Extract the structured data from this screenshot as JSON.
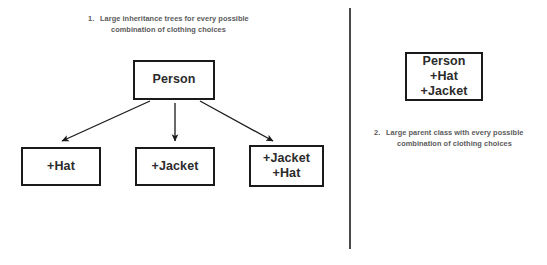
{
  "diagram": {
    "title_visible": false,
    "colors": {
      "box_border": "#1a1a1a",
      "box_text": "#2b2b2b",
      "caption_text": "#5b5b5b",
      "arrow": "#1a1a1a",
      "divider": "#4a4a4a",
      "background": "#ffffff"
    },
    "left_panel": {
      "caption": {
        "number": "1.",
        "line1": "Large inheritance trees for every possible",
        "line2": "combination of clothing choices"
      },
      "parent_box": {
        "lines": [
          "Person"
        ]
      },
      "child_boxes": [
        {
          "lines": [
            "+Hat"
          ]
        },
        {
          "lines": [
            "+Jacket"
          ]
        },
        {
          "lines": [
            "+Jacket",
            "+Hat"
          ]
        }
      ],
      "arrows": [
        {
          "name": "arrow-person-to-hat",
          "from": [
            150,
            101
          ],
          "to": [
            62,
            141
          ]
        },
        {
          "name": "arrow-person-to-jacket",
          "from": [
            175,
            103
          ],
          "to": [
            175,
            141
          ]
        },
        {
          "name": "arrow-person-to-jacket-hat",
          "from": [
            200,
            101
          ],
          "to": [
            273,
            141
          ]
        }
      ]
    },
    "right_panel": {
      "combined_box": {
        "lines": [
          "Person",
          "+Hat",
          "+Jacket"
        ]
      },
      "caption": {
        "number": "2.",
        "line1": "Large parent class with every possible",
        "line2": "combination of clothing choices"
      }
    }
  }
}
